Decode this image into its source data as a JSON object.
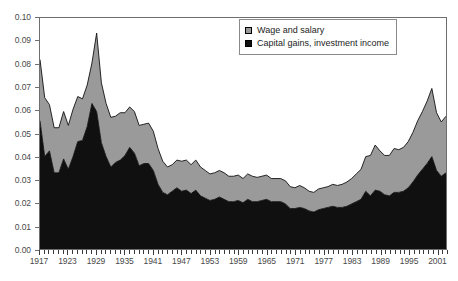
{
  "chart_data": {
    "type": "area",
    "stacked": true,
    "title": "",
    "subtitle": "",
    "xlabel": "",
    "ylabel": "",
    "ylim": [
      0.0,
      0.1
    ],
    "xlim": [
      1917,
      2003
    ],
    "grid": false,
    "legend_position": "top-right",
    "y_ticks": [
      "0.00",
      "0.01",
      "0.02",
      "0.03",
      "0.04",
      "0.05",
      "0.06",
      "0.07",
      "0.08",
      "0.09",
      "0.10"
    ],
    "y_tick_values": [
      0.0,
      0.01,
      0.02,
      0.03,
      0.04,
      0.05,
      0.06,
      0.07,
      0.08,
      0.09,
      0.1
    ],
    "x_tick_labels": [
      "1917",
      "1923",
      "1929",
      "1935",
      "1941",
      "1947",
      "1953",
      "1959",
      "1965",
      "1971",
      "1977",
      "1983",
      "1989",
      "1995",
      "2001"
    ],
    "x_tick_values": [
      1917,
      1923,
      1929,
      1935,
      1941,
      1947,
      1953,
      1959,
      1965,
      1971,
      1977,
      1983,
      1989,
      1995,
      2001
    ],
    "x": [
      1917,
      1918,
      1919,
      1920,
      1921,
      1922,
      1923,
      1924,
      1925,
      1926,
      1927,
      1928,
      1929,
      1930,
      1931,
      1932,
      1933,
      1934,
      1935,
      1936,
      1937,
      1938,
      1939,
      1940,
      1941,
      1942,
      1943,
      1944,
      1945,
      1946,
      1947,
      1948,
      1949,
      1950,
      1951,
      1952,
      1953,
      1954,
      1955,
      1956,
      1957,
      1958,
      1959,
      1960,
      1961,
      1962,
      1963,
      1964,
      1965,
      1966,
      1967,
      1968,
      1969,
      1970,
      1971,
      1972,
      1973,
      1974,
      1975,
      1976,
      1977,
      1978,
      1979,
      1980,
      1981,
      1982,
      1983,
      1984,
      1985,
      1986,
      1987,
      1988,
      1989,
      1990,
      1991,
      1992,
      1993,
      1994,
      1995,
      1996,
      1997,
      1998,
      1999,
      2000,
      2001,
      2002,
      2003
    ],
    "series": [
      {
        "name": "Capital gains, investment income",
        "color": "#101010",
        "values": [
          0.0555,
          0.04,
          0.0425,
          0.033,
          0.033,
          0.039,
          0.0345,
          0.04,
          0.0465,
          0.047,
          0.053,
          0.063,
          0.0595,
          0.046,
          0.04,
          0.0355,
          0.0375,
          0.0385,
          0.0405,
          0.044,
          0.0415,
          0.036,
          0.037,
          0.037,
          0.034,
          0.028,
          0.0245,
          0.0235,
          0.025,
          0.0265,
          0.025,
          0.0255,
          0.024,
          0.0255,
          0.023,
          0.022,
          0.021,
          0.0215,
          0.0225,
          0.0215,
          0.0205,
          0.0205,
          0.021,
          0.02,
          0.0215,
          0.0205,
          0.0205,
          0.021,
          0.0215,
          0.0205,
          0.0205,
          0.0205,
          0.0195,
          0.0175,
          0.0175,
          0.018,
          0.0175,
          0.0165,
          0.016,
          0.017,
          0.0175,
          0.018,
          0.0185,
          0.018,
          0.018,
          0.0185,
          0.0195,
          0.0205,
          0.0215,
          0.025,
          0.023,
          0.0255,
          0.025,
          0.0235,
          0.023,
          0.0245,
          0.0245,
          0.025,
          0.0265,
          0.029,
          0.032,
          0.0345,
          0.037,
          0.04,
          0.034,
          0.0315,
          0.033
        ]
      },
      {
        "name": "Wage and salary",
        "color": "#9a9a9a",
        "values": [
          0.0265,
          0.0255,
          0.02,
          0.0195,
          0.0195,
          0.0205,
          0.019,
          0.0205,
          0.0195,
          0.018,
          0.018,
          0.0175,
          0.034,
          0.026,
          0.023,
          0.0215,
          0.02,
          0.0205,
          0.0185,
          0.0175,
          0.018,
          0.0175,
          0.017,
          0.0175,
          0.017,
          0.0155,
          0.0135,
          0.012,
          0.0115,
          0.012,
          0.013,
          0.013,
          0.0125,
          0.013,
          0.0125,
          0.012,
          0.0115,
          0.0115,
          0.0115,
          0.0115,
          0.011,
          0.011,
          0.011,
          0.0105,
          0.011,
          0.011,
          0.0105,
          0.0105,
          0.0105,
          0.01,
          0.01,
          0.01,
          0.01,
          0.0095,
          0.009,
          0.0095,
          0.009,
          0.0085,
          0.0085,
          0.009,
          0.009,
          0.009,
          0.0095,
          0.0095,
          0.01,
          0.0105,
          0.011,
          0.012,
          0.013,
          0.015,
          0.0175,
          0.0195,
          0.0175,
          0.017,
          0.0175,
          0.019,
          0.0185,
          0.019,
          0.02,
          0.0215,
          0.0235,
          0.025,
          0.027,
          0.0295,
          0.025,
          0.0235,
          0.0245
        ]
      }
    ]
  },
  "legend": {
    "items": [
      {
        "label": "Wage and salary",
        "swatch": "wage"
      },
      {
        "label": "Capital gains, investment income",
        "swatch": "capital"
      }
    ]
  }
}
